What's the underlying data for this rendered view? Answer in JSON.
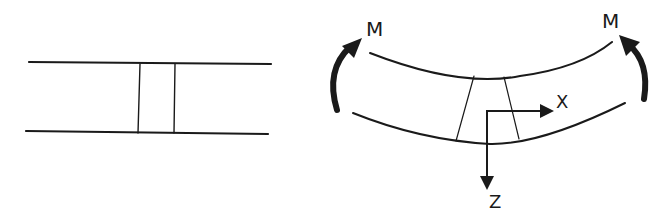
{
  "diagram": {
    "left_figure": {
      "description": "undeformed beam segment with element"
    },
    "right_figure": {
      "description": "bent beam under moment M with x-z axes",
      "moment_left_label": "M",
      "moment_right_label": "M",
      "axis_x_label": "X",
      "axis_z_label": "Z"
    },
    "colors": {
      "stroke": "#1a1a1a"
    }
  }
}
